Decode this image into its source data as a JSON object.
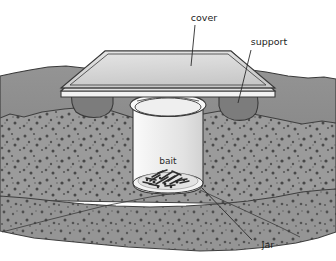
{
  "figure": {
    "labels": {
      "cover": "cover",
      "support": "support",
      "bait": "bait",
      "jar": "jar"
    },
    "colors": {
      "background": "#ffffff",
      "cover_top": "#d8d8d8",
      "cover_edge": "#bdbdbd",
      "cover_side": "#efefef",
      "soil_upper": "#8f8f8f",
      "soil_lower": "#9a9a9a",
      "soil_deep": "#939393",
      "speck": "#4a4a4a",
      "support_rock": "#7a7a7a",
      "jar_body": "#ececec",
      "jar_rim": "#f7f7f7",
      "bait": "#2f2f2f",
      "outline": "#3a3a3a",
      "label_text": "#1d1d1d"
    },
    "parts": [
      {
        "name": "cover",
        "kind": "flat-plate",
        "label": "cover"
      },
      {
        "name": "support",
        "kind": "rock",
        "label": "support"
      },
      {
        "name": "jar",
        "kind": "cylinder",
        "label": "jar"
      },
      {
        "name": "bait",
        "kind": "debris-pile",
        "label": "bait"
      }
    ]
  }
}
